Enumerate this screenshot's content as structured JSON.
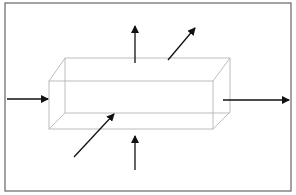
{
  "diagram": {
    "colors": {
      "frame": "#555555",
      "box_edge": "#bbbbbb",
      "arrow": "#111111",
      "charges": "#111111"
    },
    "labels": {
      "current_in": "I",
      "current_out": "I",
      "field_top": "B",
      "field_bottom": "B",
      "e_top_main": "E",
      "e_top_sub": "к",
      "e_bottom_main": "E",
      "e_bottom_sub": "н"
    },
    "charges": {
      "top_rows": 2,
      "top_type": "positive-dots",
      "bottom_rows": 2,
      "bottom_type": "negative-dashes"
    }
  }
}
